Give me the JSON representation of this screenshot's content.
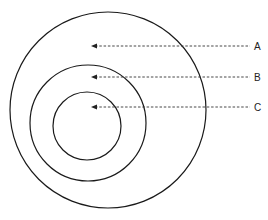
{
  "diagram": {
    "type": "concentric-circles",
    "stroke_color": "#1a1a1a",
    "circles": [
      {
        "name": "outer",
        "cx": 108,
        "cy": 110,
        "r": 98
      },
      {
        "name": "middle",
        "cx": 88,
        "cy": 123,
        "r": 58
      },
      {
        "name": "inner",
        "cx": 87,
        "cy": 126,
        "r": 34
      }
    ],
    "callouts": [
      {
        "label": "A",
        "y": 46,
        "target_x": 91,
        "line_end_x": 250,
        "label_x": 254
      },
      {
        "label": "B",
        "y": 77,
        "target_x": 91,
        "line_end_x": 250,
        "label_x": 254
      },
      {
        "label": "C",
        "y": 107,
        "target_x": 91,
        "line_end_x": 250,
        "label_x": 254
      }
    ]
  }
}
